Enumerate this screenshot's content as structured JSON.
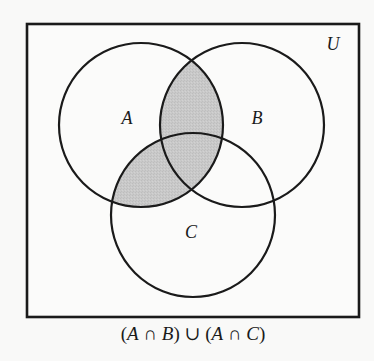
{
  "diagram": {
    "type": "venn-3",
    "universe": {
      "label": "U",
      "rect": {
        "x": 27,
        "y": 24,
        "width": 332,
        "height": 293
      }
    },
    "sets": [
      {
        "name": "A",
        "label": "A",
        "cx": 141,
        "cy": 125,
        "r": 82,
        "label_x": 127,
        "label_y": 124
      },
      {
        "name": "B",
        "label": "B",
        "cx": 242,
        "cy": 125,
        "r": 82,
        "label_x": 257,
        "label_y": 124
      },
      {
        "name": "C",
        "label": "C",
        "cx": 193,
        "cy": 215,
        "r": 82,
        "label_x": 190,
        "label_y": 238
      }
    ],
    "shaded_expression": "(A ∩ B) ∪ (A ∩ C)",
    "caption": {
      "open1": "(",
      "a1": "A",
      "cap1": " ∩ ",
      "b": "B",
      "close1": ")",
      "cup": " ∪ ",
      "open2": "(",
      "a2": "A",
      "cap2": " ∩ ",
      "c": "C",
      "close2": ")"
    },
    "colors": {
      "shade": "#c6c6c6",
      "stroke": "#1a1a1a",
      "background": "#f9f9f8"
    }
  }
}
